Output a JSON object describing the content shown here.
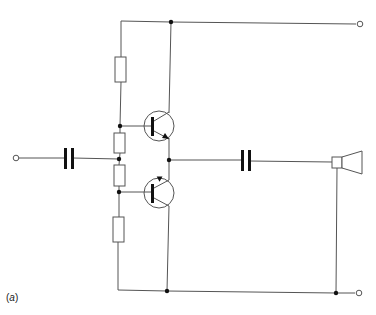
{
  "figure": {
    "type": "circuit-schematic",
    "label_open": "(",
    "label_letter": "a",
    "label_close": ")"
  },
  "colors": {
    "wire": "#555555",
    "dot": "#111111",
    "capacitor": "#111111",
    "background": "#ffffff"
  },
  "components": [
    {
      "id": "input-terminal",
      "kind": "terminal",
      "x": 16,
      "y": 158
    },
    {
      "id": "input-capacitor",
      "kind": "capacitor",
      "x": 68,
      "y": 158
    },
    {
      "id": "r1",
      "kind": "resistor",
      "position": "top"
    },
    {
      "id": "r2",
      "kind": "resistor",
      "position": "upper-middle"
    },
    {
      "id": "r3",
      "kind": "resistor",
      "position": "lower-middle"
    },
    {
      "id": "r4",
      "kind": "resistor",
      "position": "bottom"
    },
    {
      "id": "q1",
      "kind": "transistor",
      "type": "NPN"
    },
    {
      "id": "q2",
      "kind": "transistor",
      "type": "PNP"
    },
    {
      "id": "output-capacitor",
      "kind": "capacitor",
      "x": 245,
      "y": 160
    },
    {
      "id": "loudspeaker",
      "kind": "speaker"
    },
    {
      "id": "supply-terminal-top",
      "kind": "terminal",
      "x": 360,
      "y": 23
    },
    {
      "id": "supply-terminal-bottom",
      "kind": "terminal",
      "x": 359,
      "y": 293
    }
  ]
}
